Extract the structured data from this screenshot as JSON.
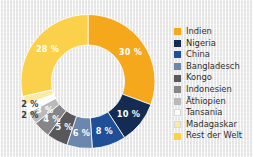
{
  "chart_data": {
    "type": "pie",
    "variant": "donut",
    "title": "",
    "subtitle": "",
    "xlabel": "",
    "ylabel": "",
    "grid": false,
    "legend_position": "right",
    "value_suffix": "%",
    "categories": [
      "Indien",
      "Nigeria",
      "China",
      "Bangladesch",
      "Kongo",
      "Indonesien",
      "Äthiopien",
      "Tansania",
      "Madagaskar",
      "Rest der Welt"
    ],
    "values": [
      30,
      10,
      8,
      6,
      5,
      4,
      3,
      2,
      2,
      28
    ],
    "labels": [
      "30 %",
      "10 %",
      "8 %",
      "6 %",
      "5 %",
      "4 %",
      "3 %",
      "2 %",
      "2 %",
      "28 %"
    ],
    "colors": [
      "#f5a81c",
      "#152c52",
      "#1f4f96",
      "#6b87ad",
      "#58585a",
      "#868688",
      "#b9babb",
      "#fdfdfb",
      "#fbeaa4",
      "#fbd14b"
    ],
    "label_colors": [
      "#ffffff",
      "#ffffff",
      "#ffffff",
      "#ffffff",
      "#ffffff",
      "#ffffff",
      "#ffffff",
      "#3a3a3a",
      "#3a3a3a",
      "#ffffff"
    ],
    "slices": [
      {
        "name": "Indien",
        "value": 30,
        "label": "30 %",
        "color": "#f5a81c",
        "label_color": "#ffffff",
        "label_placement": "inside"
      },
      {
        "name": "Nigeria",
        "value": 10,
        "label": "10 %",
        "color": "#152c52",
        "label_color": "#ffffff",
        "label_placement": "inside"
      },
      {
        "name": "China",
        "value": 8,
        "label": "8 %",
        "color": "#1f4f96",
        "label_color": "#ffffff",
        "label_placement": "inside"
      },
      {
        "name": "Bangladesch",
        "value": 6,
        "label": "6 %",
        "color": "#6b87ad",
        "label_color": "#ffffff",
        "label_placement": "inside"
      },
      {
        "name": "Kongo",
        "value": 5,
        "label": "5 %",
        "color": "#58585a",
        "label_color": "#ffffff",
        "label_placement": "inside"
      },
      {
        "name": "Indonesien",
        "value": 4,
        "label": "4 %",
        "color": "#868688",
        "label_color": "#ffffff",
        "label_placement": "inside"
      },
      {
        "name": "Äthiopien",
        "value": 3,
        "label": "3 %",
        "color": "#b9babb",
        "label_color": "#ffffff",
        "label_placement": "inside"
      },
      {
        "name": "Tansania",
        "value": 2,
        "label": "2 %",
        "color": "#fdfdfb",
        "label_color": "#3a3a3a",
        "label_placement": "outside"
      },
      {
        "name": "Madagaskar",
        "value": 2,
        "label": "2 %",
        "color": "#fbeaa4",
        "label_color": "#3a3a3a",
        "label_placement": "outside"
      },
      {
        "name": "Rest der Welt",
        "value": 28,
        "label": "28 %",
        "color": "#fbd14b",
        "label_color": "#ffffff",
        "label_placement": "inside"
      }
    ]
  },
  "donut": {
    "label_30": "30 %",
    "label_10": "10 %",
    "label_8": "8 %",
    "label_6": "6 %",
    "label_5": "5 %",
    "label_4": "4 %",
    "label_3": "3 %",
    "label_2_tansania": "2 %",
    "label_2_madagaskar": "2 %",
    "label_28": "28 %"
  },
  "legend": {
    "items": [
      {
        "label": "Indien",
        "color": "#f5a81c"
      },
      {
        "label": "Nigeria",
        "color": "#152c52"
      },
      {
        "label": "China",
        "color": "#1f4f96"
      },
      {
        "label": "Bangladesch",
        "color": "#6b87ad"
      },
      {
        "label": "Kongo",
        "color": "#58585a"
      },
      {
        "label": "Indonesien",
        "color": "#868688"
      },
      {
        "label": "Äthiopien",
        "color": "#b9babb"
      },
      {
        "label": "Tansania",
        "color": "#fdfdfb"
      },
      {
        "label": "Madagaskar",
        "color": "#fbeaa4"
      },
      {
        "label": "Rest der Welt",
        "color": "#fbd14b"
      }
    ]
  },
  "background": {
    "color": "#efefef"
  }
}
